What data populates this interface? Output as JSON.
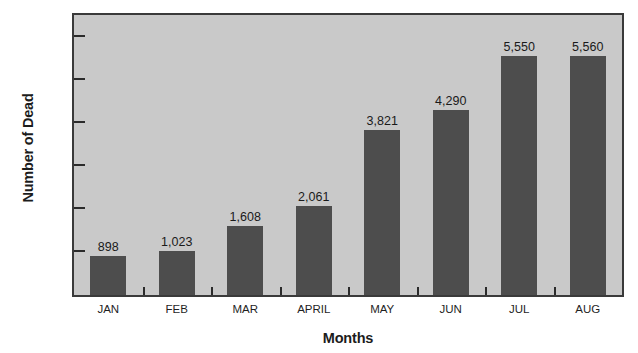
{
  "chart_data": {
    "type": "bar",
    "title": "Death Rate in the Warsaw Ghetto, January–August 1941",
    "xlabel": "Months",
    "ylabel": "Number of Dead",
    "categories": [
      "JAN",
      "FEB",
      "MAR",
      "APRIL",
      "MAY",
      "JUN",
      "JUL",
      "AUG"
    ],
    "values": [
      898,
      1023,
      1608,
      2061,
      3821,
      4290,
      5550,
      5560
    ],
    "value_labels": [
      "898",
      "1,023",
      "1,608",
      "2,061",
      "3,821",
      "4,290",
      "5,550",
      "5,560"
    ],
    "ylim": [
      0,
      6500
    ],
    "yticks": [
      0,
      1000,
      2000,
      3000,
      4000,
      5000,
      6000
    ],
    "ytick_labels": [
      "0",
      "1000",
      "2000",
      "3000",
      "4000",
      "5000",
      "6000"
    ],
    "grid": false,
    "legend": null,
    "colors": {
      "bar": "#4d4d4d",
      "plot_background": "#c9c9c9",
      "border": "#3a3a3a",
      "text": "#1c1c1c",
      "page_background": "#ffffff"
    }
  }
}
